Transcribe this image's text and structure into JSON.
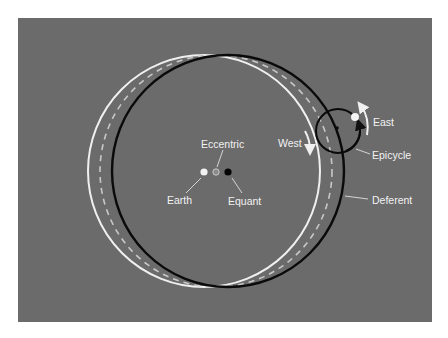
{
  "figure": {
    "background_color": "#6b6b6b",
    "labels": {
      "eccentric": "Eccentric",
      "earth": "Earth",
      "equant": "Equant",
      "west": "West",
      "east": "East",
      "epicycle": "Epicycle",
      "deferent": "Deferent"
    },
    "circles": [
      {
        "name": "earth-centered-circle",
        "style": "white solid"
      },
      {
        "name": "eccentric-circle",
        "style": "light gray dashed"
      },
      {
        "name": "deferent",
        "style": "black solid"
      },
      {
        "name": "epicycle",
        "style": "black solid"
      }
    ],
    "points": [
      {
        "name": "Earth",
        "color": "#f2f2f2"
      },
      {
        "name": "Eccentric",
        "color": "#8a8a8a"
      },
      {
        "name": "Equant",
        "color": "#000000"
      },
      {
        "name": "Planet",
        "color": "#f5f5f5"
      }
    ]
  }
}
